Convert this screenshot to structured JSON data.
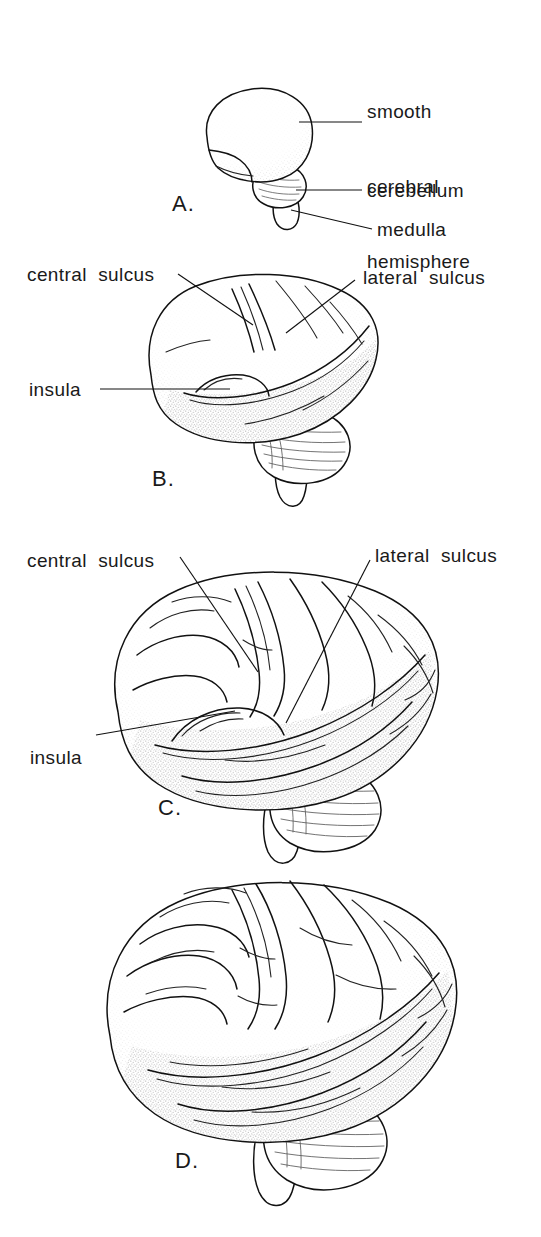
{
  "figure": {
    "background_color": "#ffffff",
    "ink_color": "#111111",
    "width": 541,
    "height": 1237
  },
  "panels": [
    {
      "id": "A",
      "letter": "A.",
      "description": "smooth fetal brain, lateral view",
      "labels": [
        {
          "name": "smooth-cerebral-hemisphere",
          "lines": [
            "smooth",
            "cerebral",
            "hemisphere"
          ],
          "text": "smooth cerebral hemisphere"
        },
        {
          "name": "cerebellum",
          "lines": [
            "cerebellum"
          ],
          "text": "cerebellum"
        },
        {
          "name": "medulla",
          "lines": [
            "medulla"
          ],
          "text": "medulla"
        }
      ]
    },
    {
      "id": "B",
      "letter": "B.",
      "description": "brain with early central and lateral sulci, insula exposed",
      "labels": [
        {
          "name": "central-sulcus",
          "lines": [
            "central  sulcus"
          ],
          "text": "central  sulcus"
        },
        {
          "name": "lateral-sulcus",
          "lines": [
            "lateral  sulcus"
          ],
          "text": "lateral  sulcus"
        },
        {
          "name": "insula",
          "lines": [
            "insula"
          ],
          "text": "insula"
        }
      ]
    },
    {
      "id": "C",
      "letter": "C.",
      "description": "brain with developed gyri, insula partly covered",
      "labels": [
        {
          "name": "central-sulcus",
          "lines": [
            "central  sulcus"
          ],
          "text": "central  sulcus"
        },
        {
          "name": "lateral-sulcus",
          "lines": [
            "lateral  sulcus"
          ],
          "text": "lateral  sulcus"
        },
        {
          "name": "insula",
          "lines": [
            "insula"
          ],
          "text": "insula"
        }
      ]
    },
    {
      "id": "D",
      "letter": "D.",
      "description": "mature adult brain, fully convoluted, insula covered",
      "labels": []
    }
  ],
  "panel_a": {
    "letter": "A.",
    "label_hemisphere_line1": "smooth",
    "label_hemisphere_line2": "cerebral",
    "label_hemisphere_line3": "hemisphere",
    "label_cerebellum": "cerebellum",
    "label_medulla": "medulla"
  },
  "panel_b": {
    "letter": "B.",
    "label_central_sulcus": "central  sulcus",
    "label_lateral_sulcus": "lateral  sulcus",
    "label_insula": "insula"
  },
  "panel_c": {
    "letter": "C.",
    "label_central_sulcus": "central  sulcus",
    "label_lateral_sulcus": "lateral  sulcus",
    "label_insula": "insula"
  },
  "panel_d": {
    "letter": "D."
  }
}
